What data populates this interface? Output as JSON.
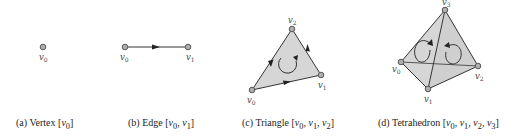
{
  "colors": {
    "vertex_fill": "#b0b0b0",
    "vertex_stroke": "#555555",
    "edge": "#333333",
    "face_fill": "#d6d6d6",
    "text": "#222222"
  },
  "figures": [
    {
      "id": "a",
      "type": "vertex",
      "caption_prefix": "(a) Vertex",
      "caption_vertices": [
        "v0"
      ],
      "vertices": [
        {
          "label": "v",
          "sub": "0",
          "x": 43,
          "y": 47
        }
      ]
    },
    {
      "id": "b",
      "type": "edge",
      "caption_prefix": "(b) Edge",
      "caption_vertices": [
        "v0",
        "v1"
      ],
      "vertices": [
        {
          "label": "v",
          "sub": "0",
          "x": 125,
          "y": 47
        },
        {
          "label": "v",
          "sub": "1",
          "x": 188,
          "y": 47
        }
      ]
    },
    {
      "id": "c",
      "type": "triangle",
      "caption_prefix": "(c) Triangle",
      "caption_vertices": [
        "v0",
        "v1",
        "v2"
      ],
      "vertices": [
        {
          "label": "v",
          "sub": "0",
          "x": 252,
          "y": 90
        },
        {
          "label": "v",
          "sub": "1",
          "x": 321,
          "y": 75
        },
        {
          "label": "v",
          "sub": "2",
          "x": 292,
          "y": 29
        }
      ]
    },
    {
      "id": "d",
      "type": "tetrahedron",
      "caption_prefix": "(d) Tetrahedron",
      "caption_vertices": [
        "v0",
        "v1",
        "v2",
        "v3"
      ],
      "vertices": [
        {
          "label": "v",
          "sub": "0",
          "x": 401,
          "y": 62
        },
        {
          "label": "v",
          "sub": "1",
          "x": 428,
          "y": 89
        },
        {
          "label": "v",
          "sub": "2",
          "x": 478,
          "y": 66
        },
        {
          "label": "v",
          "sub": "3",
          "x": 445,
          "y": 10
        }
      ]
    }
  ],
  "captions": {
    "a": {
      "prefix": "(a) Vertex",
      "open": "[",
      "v0": "v",
      "s0": "0",
      "close": "]"
    },
    "b": {
      "prefix": "(b) Edge",
      "v0": "v",
      "s0": "0",
      "v1": "v",
      "s1": "1"
    },
    "c": {
      "prefix": "(c) Triangle",
      "v0": "v",
      "s0": "0",
      "v1": "v",
      "s1": "1",
      "v2": "v",
      "s2": "2"
    },
    "d": {
      "prefix": "(d) Tetrahedron",
      "v0": "v",
      "s0": "0",
      "v1": "v",
      "s1": "1",
      "v2": "v",
      "s2": "2",
      "v3": "v",
      "s3": "3"
    }
  },
  "labels": {
    "a_v0": "v",
    "a_s0": "0",
    "b_v0": "v",
    "b_s0": "0",
    "b_v1": "v",
    "b_s1": "1",
    "c_v0": "v",
    "c_s0": "0",
    "c_v1": "v",
    "c_s1": "1",
    "c_v2": "v",
    "c_s2": "2",
    "d_v0": "v",
    "d_s0": "0",
    "d_v1": "v",
    "d_s1": "1",
    "d_v2": "v",
    "d_s2": "2",
    "d_v3": "v",
    "d_s3": "3"
  }
}
